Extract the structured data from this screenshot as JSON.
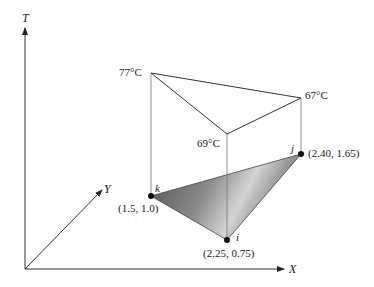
{
  "axes": {
    "t_label": "T",
    "x_label": "X",
    "y_label": "Y"
  },
  "temperatures": {
    "k_top": "77°C",
    "j_top": "67°C",
    "i_top": "69°C"
  },
  "points": {
    "k": {
      "label": "k",
      "coords": "(1.5, 1.0)"
    },
    "i": {
      "label": "i",
      "coords": "(2.25, 0.75)"
    },
    "j": {
      "label": "j",
      "coords": "(2.40, 1.65)"
    }
  },
  "colors": {
    "line": "#333333",
    "thin_line": "#777777",
    "triangle_dark": "#555555",
    "triangle_light": "#d8d8d8"
  }
}
